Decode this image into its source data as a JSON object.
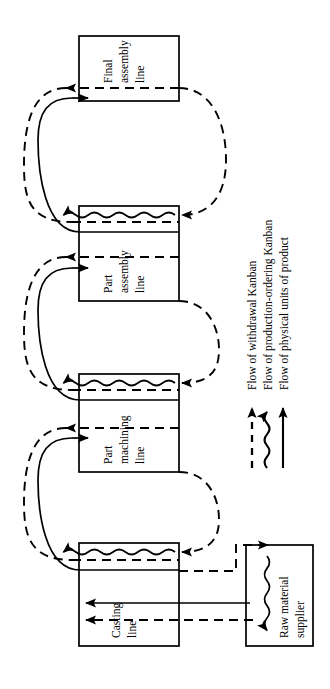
{
  "diagram": {
    "orientation": "rotated-90",
    "colors": {
      "stroke": "#000000",
      "fill": "#ffffff",
      "background": "#ffffff"
    },
    "nodes": [
      {
        "id": "final-assembly",
        "lines": [
          "Final",
          "assembly",
          "line"
        ]
      },
      {
        "id": "part-assembly",
        "lines": [
          "Part",
          "assembly",
          "line"
        ]
      },
      {
        "id": "part-machining",
        "lines": [
          "Part",
          "machining",
          "line"
        ]
      },
      {
        "id": "casting",
        "lines": [
          "Casting",
          "line"
        ]
      },
      {
        "id": "raw-material",
        "lines": [
          "Raw material",
          "supplier"
        ]
      }
    ],
    "legend": {
      "entries": [
        {
          "id": "withdrawal-kanban",
          "style": "dashed",
          "label": "Flow of withdrawal Kanban"
        },
        {
          "id": "production-ordering-kanban",
          "style": "wavy",
          "label": "Flow of production-ordering Kanban"
        },
        {
          "id": "physical-units",
          "style": "solid",
          "label": "Flow of physical units of product"
        }
      ]
    }
  }
}
